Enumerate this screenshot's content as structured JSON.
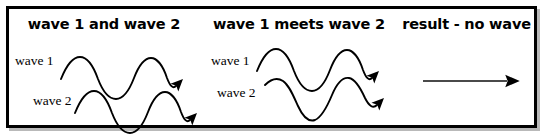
{
  "diagram": {
    "title_alt": "destructive interference of two waves",
    "border_color": "#000000",
    "background": "#ffffff",
    "panels": [
      {
        "id": "wave-1-and-wave-2",
        "heading": "wave 1 and wave 2",
        "labels": [
          {
            "name": "wave-1-label",
            "text": "wave 1"
          },
          {
            "name": "wave-2-label",
            "text": "wave 2"
          }
        ],
        "waves": [
          {
            "name": "wave-1-curve",
            "cycles": 2,
            "phase_deg": 0,
            "arrow": true,
            "stroke": "#000000"
          },
          {
            "name": "wave-2-curve",
            "cycles": 2,
            "phase_deg": 0,
            "arrow": true,
            "stroke": "#000000"
          }
        ]
      },
      {
        "id": "wave-1-meets-wave-2",
        "heading": "wave 1 meets wave 2",
        "labels": [
          {
            "name": "wave-1-label",
            "text": "wave 1"
          },
          {
            "name": "wave-2-label",
            "text": "wave 2"
          }
        ],
        "waves": [
          {
            "name": "wave-1-curve",
            "cycles": 2,
            "phase_deg": 0,
            "arrow": true,
            "stroke": "#000000"
          },
          {
            "name": "wave-2-curve",
            "cycles": 2,
            "phase_deg": 180,
            "arrow": true,
            "stroke": "#000000"
          }
        ]
      },
      {
        "id": "result-no-wave",
        "heading": "result - no wave",
        "labels": [],
        "result_arrow": {
          "name": "flat-line-arrow",
          "stroke": "#4a4a4a",
          "head_color": "#000000",
          "description": "straight horizontal line with arrowhead (zero amplitude)"
        }
      }
    ]
  }
}
